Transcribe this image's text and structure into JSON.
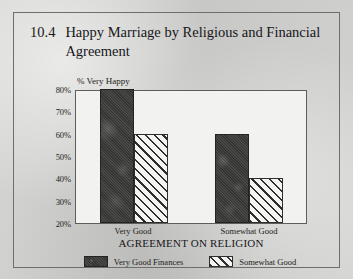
{
  "figure": {
    "number": "10.4",
    "caption": "Happy Marriage by Religious and Financial Agreement"
  },
  "chart_data": {
    "type": "bar",
    "title": "Happy Marriage by Religious and Financial Agreement",
    "xlabel": "AGREEMENT ON RELIGION",
    "ylabel": "% Very Happy",
    "categories": [
      "Very Good",
      "Somewhat Good"
    ],
    "series": [
      {
        "name": "Very Good Finances",
        "values": [
          80,
          60
        ]
      },
      {
        "name": "Somewhat Good",
        "values": [
          60,
          40
        ]
      }
    ],
    "ylim": [
      20,
      80
    ],
    "yticks": [
      "20%",
      "30%",
      "40%",
      "50%",
      "60%",
      "70%",
      "80%"
    ],
    "ytick_values": [
      20,
      30,
      40,
      50,
      60,
      70,
      80
    ],
    "grid": false,
    "legend_position": "bottom"
  }
}
